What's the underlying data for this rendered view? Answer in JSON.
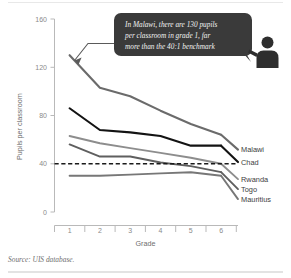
{
  "chart_data": {
    "type": "line",
    "title": "",
    "xlabel": "Grade",
    "ylabel": "Pupils per classroom",
    "categories": [
      "1",
      "2",
      "3",
      "4",
      "5",
      "6"
    ],
    "x": [
      1,
      2,
      3,
      4,
      5,
      6
    ],
    "xlim": [
      0.5,
      6.5
    ],
    "ylim": [
      0,
      160
    ],
    "yticks": [
      "0",
      "40",
      "80",
      "120",
      "160"
    ],
    "ytick_values": [
      0,
      40,
      80,
      120,
      160
    ],
    "grid": false,
    "legend_position": "right-inline-labels",
    "series": [
      {
        "name": "Malawi",
        "values": [
          130,
          103,
          96,
          84,
          73,
          64
        ],
        "color": "#6b6b6b",
        "width": 2.1
      },
      {
        "name": "Chad",
        "values": [
          86,
          68,
          66,
          63,
          55,
          55
        ],
        "color": "#131313",
        "width": 2.1
      },
      {
        "name": "Rwanda",
        "values": [
          63,
          57,
          53,
          49,
          45,
          40
        ],
        "color": "#8d8d8d",
        "width": 1.9
      },
      {
        "name": "Togo",
        "values": [
          56,
          46,
          46,
          41,
          38,
          33
        ],
        "color": "#5f5f5f",
        "width": 1.9
      },
      {
        "name": "Mauritius",
        "values": [
          30,
          30,
          31,
          32,
          33,
          30
        ],
        "color": "#777777",
        "width": 1.9
      }
    ],
    "benchmark": {
      "name": "40:1 benchmark",
      "value": 40,
      "style": "dashed",
      "color": "#1a1a1a"
    },
    "annotation": {
      "lines": [
        "In Malawi, there are 130 pupils",
        "per classroom in grade 1, far",
        "more than the 40:1 benchmark"
      ],
      "full_text": "In Malawi, there are 130 pupils per classroom in grade 1, far more than the 40:1 benchmark",
      "points_to": {
        "series": "Malawi",
        "grade": 1,
        "value": 130
      },
      "background_color": "#3a3a3a",
      "text_color": "#f2f2f2"
    }
  },
  "footer": {
    "source": "Source: UIS database."
  },
  "icons": {
    "teacher": "teacher-icon"
  }
}
